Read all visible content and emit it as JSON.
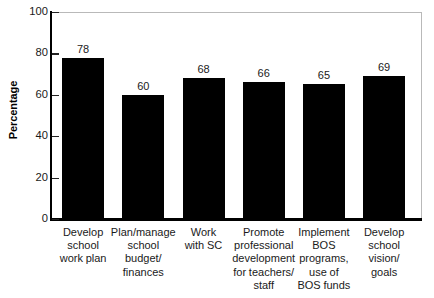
{
  "chart_data": {
    "type": "bar",
    "title": "",
    "xlabel": "",
    "ylabel": "Percentage",
    "ylim": [
      0,
      100
    ],
    "yticks": [
      0,
      20,
      40,
      60,
      80,
      100
    ],
    "grid": false,
    "legend": false,
    "bar_color": "#000000",
    "categories": [
      "Develop school work plan",
      "Plan/manage school budget/ finances",
      "Work with SC",
      "Promote professional development for teachers/ staff",
      "Implement BOS programs, use of BOS funds",
      "Develop school vision/ goals"
    ],
    "category_lines": [
      [
        "Develop",
        "school",
        "work plan"
      ],
      [
        "Plan/manage",
        "school",
        "budget/",
        "finances"
      ],
      [
        "Work",
        "with SC"
      ],
      [
        "Promote",
        "professional",
        "development",
        "for teachers/",
        "staff"
      ],
      [
        "Implement",
        "BOS",
        "programs,",
        "use of",
        "BOS funds"
      ],
      [
        "Develop",
        "school",
        "vision/",
        "goals"
      ]
    ],
    "values": [
      78,
      60,
      68,
      66,
      65,
      69
    ],
    "value_labels": [
      "78",
      "60",
      "68",
      "66",
      "65",
      "69"
    ]
  },
  "axis": {
    "y_tick_labels": [
      "100",
      "80",
      "60",
      "40",
      "20",
      "0"
    ],
    "y_title": "Percentage"
  }
}
